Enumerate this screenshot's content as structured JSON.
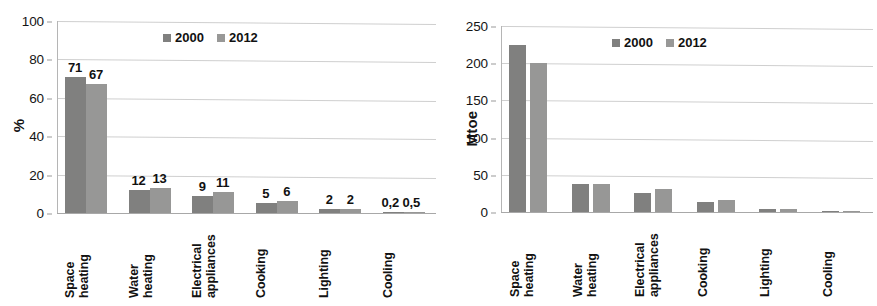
{
  "figure": {
    "panels": [
      "share",
      "absolute"
    ],
    "series_colors": {
      "2000": "#80807f",
      "2012": "#979796"
    },
    "gridline_color": "#cfcfcf",
    "background": "#ffffff"
  },
  "categories": [
    {
      "line1": "Space",
      "line2": "heating"
    },
    {
      "line1": "Water",
      "line2": "heating"
    },
    {
      "line1": "Electrical",
      "line2": "appliances"
    },
    {
      "line1": "Cooking",
      "line2": ""
    },
    {
      "line1": "Lighting",
      "line2": ""
    },
    {
      "line1": "Cooling",
      "line2": ""
    }
  ],
  "legend": {
    "items": [
      {
        "label": "2000",
        "key": "s2000"
      },
      {
        "label": "2012",
        "key": "s2012"
      }
    ]
  },
  "left": {
    "ylabel": "%",
    "yticks": [
      "0",
      "20",
      "40",
      "60",
      "80",
      "100"
    ],
    "data_labels_2000": [
      "71",
      "12",
      "9",
      "5",
      "2",
      "0,2"
    ],
    "data_labels_2012": [
      "67",
      "13",
      "11",
      "6",
      "2",
      "0,5"
    ]
  },
  "right": {
    "ylabel": "Mtoe",
    "yticks": [
      "0",
      "50",
      "100",
      "150",
      "200",
      "250"
    ],
    "data_labels_2000": [],
    "data_labels_2012": []
  },
  "chart_data": [
    {
      "type": "bar",
      "panel": "left",
      "title": "",
      "xlabel": "",
      "ylabel": "%",
      "ylim": [
        0,
        100
      ],
      "yticks": [
        0,
        20,
        40,
        60,
        80,
        100
      ],
      "grid": true,
      "legend_position": "top-center-inside",
      "categories": [
        "Space heating",
        "Water heating",
        "Electrical appliances",
        "Cooking",
        "Lighting",
        "Cooling"
      ],
      "series": [
        {
          "name": "2000",
          "values": [
            71,
            12,
            9,
            5,
            2,
            0.2
          ],
          "color": "#80807f"
        },
        {
          "name": "2012",
          "values": [
            67,
            13,
            11,
            6,
            2,
            0.5
          ],
          "color": "#979796"
        }
      ],
      "data_labels": [
        [
          "71",
          "12",
          "9",
          "5",
          "2",
          "0,2"
        ],
        [
          "67",
          "13",
          "11",
          "6",
          "2",
          "0,5"
        ]
      ]
    },
    {
      "type": "bar",
      "panel": "right",
      "title": "",
      "xlabel": "",
      "ylabel": "Mtoe",
      "ylim": [
        0,
        250
      ],
      "yticks": [
        0,
        50,
        100,
        150,
        200,
        250
      ],
      "grid": true,
      "legend_position": "top-center-inside",
      "categories": [
        "Space heating",
        "Water heating",
        "Electrical appliances",
        "Cooking",
        "Lighting",
        "Cooling"
      ],
      "series": [
        {
          "name": "2000",
          "values": [
            225,
            37,
            26,
            13,
            4,
            0.3
          ],
          "color": "#80807f"
        },
        {
          "name": "2012",
          "values": [
            200,
            38,
            31,
            16,
            4,
            0.7
          ],
          "color": "#979796"
        }
      ],
      "data_labels": [
        [],
        []
      ]
    }
  ]
}
